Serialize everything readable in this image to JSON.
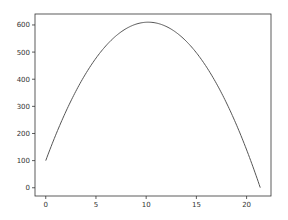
{
  "chart_data": {
    "type": "line",
    "title": "",
    "xlabel": "",
    "ylabel": "",
    "xlim": [
      -1.07,
      22.43
    ],
    "ylim": [
      -30.4,
      640.4
    ],
    "xticks": [
      0,
      5,
      10,
      15,
      20
    ],
    "yticks": [
      0,
      100,
      200,
      300,
      400,
      500,
      600
    ],
    "grid": false,
    "legend": null,
    "series": [
      {
        "name": "y",
        "color": "#555555",
        "formula": "y = 100 + 100*x - 4.9*x^2",
        "x": [
          0,
          1,
          2,
          3,
          4,
          5,
          6,
          7,
          8,
          9,
          10,
          10.2,
          11,
          12,
          13,
          14,
          15,
          16,
          17,
          18,
          19,
          20,
          21,
          21.36
        ],
        "y": [
          100,
          195.1,
          280.4,
          355.9,
          421.6,
          477.5,
          523.6,
          559.9,
          586.4,
          603.1,
          610.0,
          610.2,
          607.1,
          594.4,
          571.9,
          539.6,
          497.5,
          445.6,
          383.9,
          312.4,
          231.1,
          140.0,
          39.1,
          0
        ]
      }
    ]
  },
  "colors": {
    "background": "#ffffff",
    "axes": "#333333",
    "line": "#555555",
    "tick_text": "#333333"
  }
}
